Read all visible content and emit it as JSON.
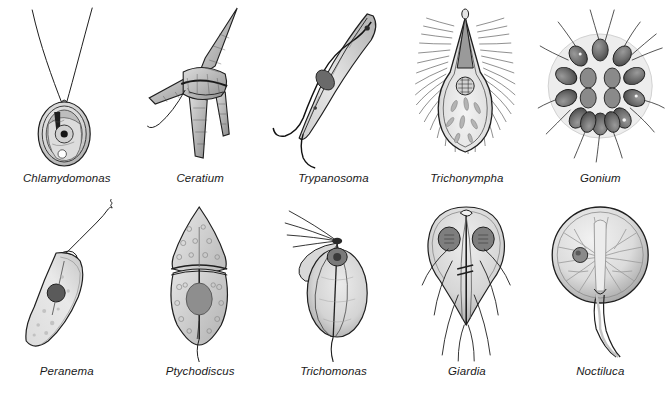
{
  "figure": {
    "kind": "scientific-illustration-plate",
    "layout": {
      "columns": 5,
      "rows": 2
    },
    "background_color": "#ffffff",
    "ink_color": "#1a1a1a",
    "fill_light": "#e8e8e8",
    "fill_mid": "#c8c8c8",
    "fill_dark": "#8a8a8a",
    "fill_darker": "#5a5a5a"
  },
  "specimens": [
    {
      "label": "Chlamydomonas",
      "icon": "chlamydomonas-icon",
      "group": "green alga",
      "flagella_count": 2,
      "features": [
        "two long anterior flagella",
        "oval cell wall",
        "cup-shaped chloroplast",
        "pyrenoid",
        "nucleus",
        "stigma eyespot"
      ]
    },
    {
      "label": "Ceratium",
      "icon": "ceratium-icon",
      "group": "dinoflagellate",
      "flagella_count": 2,
      "features": [
        "armored thecal plates",
        "long apical horn",
        "two antapical horns",
        "cingulum groove",
        "trailing flagellum"
      ]
    },
    {
      "label": "Trypanosoma",
      "icon": "trypanosoma-icon",
      "group": "kinetoplastid",
      "flagella_count": 1,
      "features": [
        "elongated S-curved body",
        "undulating membrane",
        "free anterior flagellum",
        "kinetoplast",
        "nucleus"
      ]
    },
    {
      "label": "Trichonympha",
      "icon": "trichonympha-icon",
      "group": "parabasalid",
      "flagella_count": 0,
      "features": [
        "pear-shaped body",
        "pointed apical rostrum",
        "dense covering of flagella",
        "nucleus",
        "wood particles in cytoplasm"
      ]
    },
    {
      "label": "Gonium",
      "icon": "gonium-icon",
      "group": "colonial green alga",
      "cell_count": 16,
      "features": [
        "gelatinous matrix disc",
        "sixteen biflagellate cells",
        "flagella radiating outward"
      ]
    },
    {
      "label": "Peranema",
      "icon": "peranema-icon",
      "group": "euglenid",
      "flagella_count": 1,
      "features": [
        "elongate teardrop body",
        "single long anterior flagellum",
        "nucleus",
        "granular cytoplasm"
      ]
    },
    {
      "label": "Ptychodiscus",
      "icon": "ptychodiscus-icon",
      "group": "dinoflagellate",
      "flagella_count": 1,
      "features": [
        "pointed epicone",
        "rounded hypocone",
        "cingulum",
        "sulcus",
        "pale vesicles",
        "nucleus",
        "trailing flagellum"
      ]
    },
    {
      "label": "Trichomonas",
      "icon": "trichomonas-icon",
      "group": "parabasalid",
      "flagella_count": 4,
      "features": [
        "oval body",
        "four anterior flagella",
        "undulating membrane",
        "nucleus",
        "axostyle"
      ]
    },
    {
      "label": "Giardia",
      "icon": "giardia-icon",
      "group": "diplomonad",
      "flagella_count": 8,
      "features": [
        "pear-shaped bilateral body",
        "two nuclei",
        "adhesive disc",
        "median bodies",
        "four pairs of flagella",
        "axonemes"
      ]
    },
    {
      "label": "Noctiluca",
      "icon": "noctiluca-icon",
      "group": "dinoflagellate",
      "flagella_count": 1,
      "features": [
        "large spherical balloon cell",
        "radiating cytoplasmic strands",
        "nucleus",
        "thick curved tentacle"
      ]
    }
  ]
}
